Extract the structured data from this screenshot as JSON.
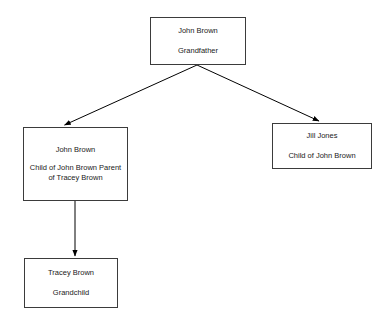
{
  "diagram": {
    "type": "family-tree",
    "background_color": "#ffffff",
    "line_color": "#000000",
    "border_color": "#3b3b3b",
    "text_color": "#1a1a1a",
    "nodes": [
      {
        "id": "grandfather",
        "name": "John Brown",
        "role": "Grandfather"
      },
      {
        "id": "parent",
        "name": "John Brown",
        "role": "Child of John Brown Parent of Tracey Brown"
      },
      {
        "id": "aunt",
        "name": "Jill Jones",
        "role": "Child of John Brown"
      },
      {
        "id": "grandchild",
        "name": "Tracey Brown",
        "role": "Grandchild"
      }
    ],
    "edges": [
      {
        "id": "grandfather-to-parent",
        "from": "grandfather",
        "to": "parent",
        "arrow": "single"
      },
      {
        "id": "grandfather-to-aunt",
        "from": "grandfather",
        "to": "aunt",
        "arrow": "single"
      },
      {
        "id": "parent-to-grandchild",
        "from": "parent",
        "to": "grandchild",
        "arrow": "single"
      }
    ]
  }
}
